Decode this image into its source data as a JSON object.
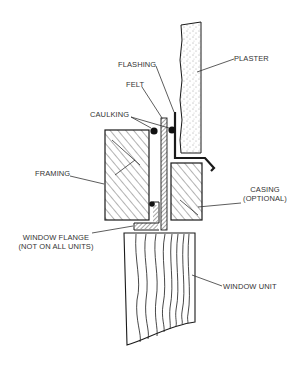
{
  "diagram": {
    "type": "cross-section",
    "labels": {
      "plaster": "PLASTER",
      "flashing": "FLASHING",
      "felt": "FELT",
      "caulking": "CAULKING",
      "framing": "FRAMING",
      "casing_line1": "CASING",
      "casing_line2": "(OPTIONAL)",
      "window_flange_line1": "WINDOW FLANGE",
      "window_flange_line2": "(NOT ON ALL UNITS)",
      "window_unit": "WINDOW UNIT"
    },
    "colors": {
      "ink": "#1a1a1a",
      "label_text": "#333333",
      "background": "#ffffff"
    }
  }
}
